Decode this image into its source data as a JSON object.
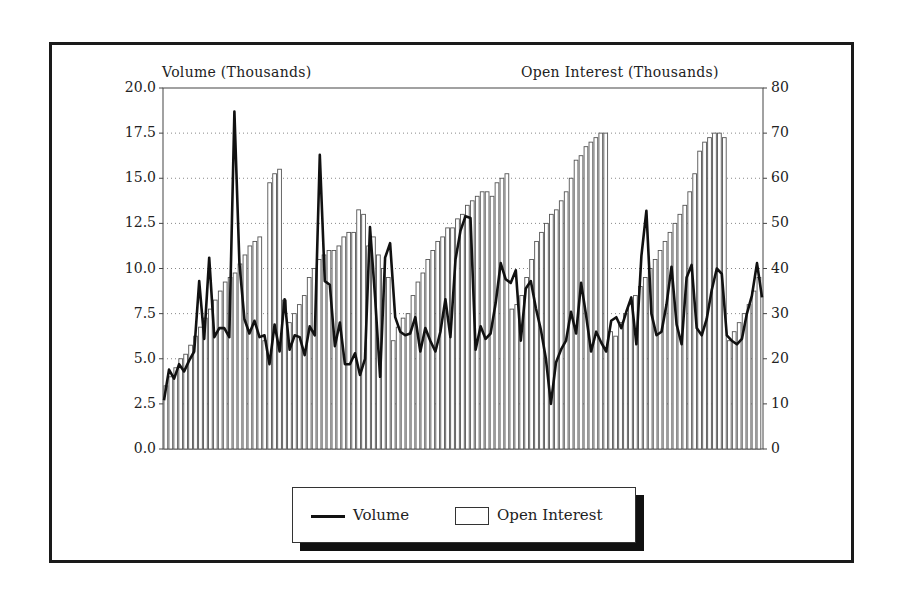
{
  "chart_data": {
    "type": "bar+line",
    "title": "",
    "left_axis": {
      "label": "Volume (Thousands)",
      "ticks": [
        "0.0",
        "2.5",
        "5.0",
        "7.5",
        "10.0",
        "12.5",
        "15.0",
        "17.5",
        "20.0"
      ],
      "range": [
        0,
        20
      ]
    },
    "right_axis": {
      "label": "Open Interest (Thousands)",
      "ticks": [
        "0",
        "10",
        "20",
        "30",
        "40",
        "50",
        "60",
        "70",
        "80"
      ],
      "range": [
        0,
        80
      ]
    },
    "grid": "dotted horizontal at each tick",
    "legend_position": "bottom-center",
    "legend": [
      "Volume",
      "Open Interest"
    ],
    "series": [
      {
        "name": "Open Interest",
        "axis": "right",
        "type": "bar",
        "values": [
          14,
          16,
          18,
          20,
          21,
          23,
          25,
          27,
          29,
          31,
          33,
          35,
          37,
          38,
          39,
          41,
          43,
          45,
          46,
          47,
          24,
          59,
          61,
          62,
          33,
          28,
          30,
          32,
          34,
          38,
          40,
          42,
          43,
          44,
          44,
          45,
          47,
          48,
          48,
          53,
          52,
          45,
          47,
          43,
          40,
          38,
          24,
          27,
          29,
          30,
          34,
          37,
          39,
          42,
          44,
          46,
          47,
          49,
          49,
          51,
          52,
          54,
          55,
          56,
          57,
          57,
          56,
          59,
          60,
          61,
          31,
          32,
          34,
          38,
          42,
          46,
          48,
          50,
          52,
          53,
          55,
          57,
          60,
          64,
          65,
          67,
          68,
          69,
          70,
          70,
          26,
          25,
          28,
          30,
          32,
          34,
          36,
          38,
          40,
          42,
          44,
          46,
          48,
          50,
          52,
          54,
          57,
          61,
          66,
          68,
          69,
          70,
          70,
          69,
          24,
          26,
          28,
          30,
          32,
          35,
          38
        ]
      },
      {
        "name": "Volume",
        "axis": "left",
        "type": "line",
        "values": [
          2.7,
          4.4,
          3.9,
          4.7,
          4.3,
          4.9,
          5.4,
          9.3,
          6.1,
          10.6,
          6.2,
          6.7,
          6.7,
          6.2,
          18.7,
          10.3,
          7.2,
          6.4,
          7.1,
          6.2,
          6.3,
          4.7,
          6.9,
          5.4,
          8.3,
          5.5,
          6.3,
          6.2,
          5.2,
          6.8,
          6.3,
          16.3,
          9.3,
          9.1,
          5.7,
          7.0,
          4.7,
          4.7,
          5.3,
          4.1,
          5.0,
          12.3,
          8.4,
          4.0,
          10.6,
          11.4,
          7.3,
          6.5,
          6.3,
          6.4,
          7.3,
          5.4,
          6.7,
          6.0,
          5.4,
          6.5,
          8.3,
          6.2,
          10.5,
          12.1,
          12.9,
          12.8,
          5.5,
          6.8,
          6.1,
          6.4,
          8.1,
          10.3,
          9.4,
          9.2,
          9.9,
          6.0,
          8.9,
          9.3,
          7.8,
          6.6,
          5.0,
          2.5,
          4.8,
          5.5,
          6.0,
          7.6,
          6.4,
          9.2,
          7.4,
          5.4,
          6.5,
          5.9,
          5.4,
          7.1,
          7.3,
          6.7,
          7.6,
          8.4,
          5.8,
          10.7,
          13.2,
          7.5,
          6.3,
          6.5,
          8.0,
          10.1,
          6.9,
          5.8,
          9.5,
          10.2,
          6.7,
          6.3,
          7.2,
          8.8,
          10.0,
          9.7,
          6.3,
          6.0,
          5.8,
          6.1,
          7.5,
          8.5,
          10.3,
          8.4
        ]
      }
    ]
  },
  "axes": {
    "left_title": "Volume (Thousands)",
    "right_title": "Open Interest (Thousands)"
  },
  "legend": {
    "volume_label": "Volume",
    "open_interest_label": "Open Interest"
  }
}
